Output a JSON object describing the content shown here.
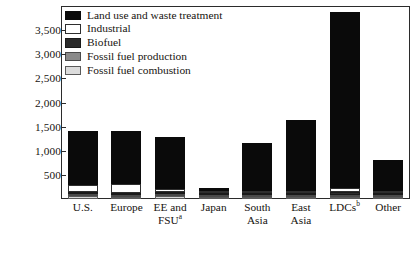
{
  "chart_data": {
    "type": "bar",
    "stacked": true,
    "title": "",
    "xlabel": "",
    "ylabel": "",
    "ylim": [
      0,
      4000
    ],
    "grid": false,
    "legend_position": "top-left-inside",
    "ytick_labels": [
      "500",
      "1,000",
      "1,500",
      "2,000",
      "2,500",
      "3,000",
      "3,500"
    ],
    "ytick_values": [
      500,
      1000,
      1500,
      2000,
      2500,
      3000,
      3500
    ],
    "categories": [
      "U.S.",
      "Europe",
      "EE and FSU",
      "Japan",
      "South Asia",
      "East Asia",
      "LDCs",
      "Other"
    ],
    "category_labels": [
      {
        "line1": "U.S.",
        "line2": "",
        "superscript": ""
      },
      {
        "line1": "Europe",
        "line2": "",
        "superscript": ""
      },
      {
        "line1": "EE and",
        "line2": "FSU",
        "superscript": "a"
      },
      {
        "line1": "Japan",
        "line2": "",
        "superscript": ""
      },
      {
        "line1": "South",
        "line2": "Asia",
        "superscript": ""
      },
      {
        "line1": "East",
        "line2": "Asia",
        "superscript": ""
      },
      {
        "line1": "LDCs",
        "line2": "",
        "superscript": "b"
      },
      {
        "line1": "Other",
        "line2": "",
        "superscript": ""
      }
    ],
    "series": [
      {
        "name": "Fossil fuel combustion",
        "key": "ffcomb",
        "color": "#dcdcdc",
        "values": [
          60,
          40,
          55,
          20,
          15,
          30,
          40,
          15
        ]
      },
      {
        "name": "Fossil fuel production",
        "key": "ffprod",
        "color": "#8a8a8a",
        "values": [
          40,
          30,
          45,
          15,
          10,
          20,
          30,
          10
        ]
      },
      {
        "name": "Biofuel",
        "key": "biofuel",
        "color": "#2a2a2a",
        "values": [
          25,
          20,
          30,
          10,
          20,
          25,
          60,
          15
        ]
      },
      {
        "name": "Industrial",
        "key": "industrial",
        "color": "#ffffff",
        "values": [
          150,
          190,
          60,
          25,
          20,
          25,
          90,
          20
        ]
      },
      {
        "name": "Land use and waste treatment",
        "key": "land",
        "color": "#0a0a0a",
        "values": [
          1125,
          1100,
          1090,
          60,
          985,
          1480,
          3650,
          640
        ]
      }
    ],
    "totals": [
      1400,
      1380,
      1280,
      130,
      1050,
      1580,
      3870,
      700
    ]
  },
  "legend": {
    "items": [
      {
        "label": "Land use and waste treatment",
        "swatch": "land-swatch"
      },
      {
        "label": "Industrial",
        "swatch": "industrial-swatch"
      },
      {
        "label": "Biofuel",
        "swatch": "biofuel-swatch"
      },
      {
        "label": "Fossil fuel production",
        "swatch": "fossil-fuel-production-swatch"
      },
      {
        "label": "Fossil fuel combustion",
        "swatch": "fossil-fuel-combustion-swatch"
      }
    ]
  }
}
